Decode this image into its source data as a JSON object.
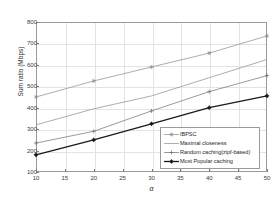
{
  "chart_data": {
    "type": "line",
    "title": "",
    "xlabel": "α",
    "ylabel": "Sum ratio (Mbps)",
    "x": [
      10,
      20,
      30,
      40,
      50
    ],
    "xlim": [
      10,
      50
    ],
    "ylim": [
      100,
      800
    ],
    "xticks": [
      10,
      15,
      20,
      25,
      30,
      35,
      40,
      45,
      50
    ],
    "yticks": [
      100,
      200,
      300,
      400,
      500,
      600,
      700,
      800
    ],
    "grid": true,
    "legend_position": "lower-right",
    "series": [
      {
        "name": "IBPSC",
        "marker": "star",
        "color": "#8a8a8a",
        "values": [
          450,
          525,
          590,
          655,
          735
        ]
      },
      {
        "name": "Maximal closeness",
        "marker": "none",
        "color": "#8a8a8a",
        "values": [
          320,
          395,
          455,
          540,
          625
        ]
      },
      {
        "name": "Random caching(zipf-based)",
        "marker": "plus",
        "color": "#6f6f6f",
        "values": [
          235,
          290,
          385,
          475,
          550
        ]
      },
      {
        "name": "Most Popular caching",
        "marker": "filled-plus",
        "color": "#1a1a1a",
        "values": [
          180,
          250,
          325,
          400,
          455
        ]
      }
    ]
  },
  "axes": {
    "ylabel": "Sum ratio (Mbps)",
    "xlabel": "α",
    "ytick_labels": [
      "800",
      "700",
      "600",
      "500",
      "400",
      "300",
      "200",
      "100"
    ],
    "xtick_labels": [
      "10",
      "15",
      "20",
      "25",
      "30",
      "35",
      "40",
      "45",
      "50"
    ]
  },
  "legend": {
    "items": [
      {
        "label": "IBPSC"
      },
      {
        "label": "Maximal closeness"
      },
      {
        "label": "Random caching(zipf-based)"
      },
      {
        "label": "Most Popular caching"
      }
    ]
  }
}
